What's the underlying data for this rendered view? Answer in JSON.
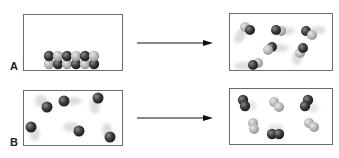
{
  "figure": {
    "panels": [
      {
        "label": "A",
        "before": {
          "state": "ordered solid lattice (two rows of packed diatomic spheres)",
          "particles": [
            {
              "cx": 49,
              "cy": 56,
              "tone": "dark"
            },
            {
              "cx": 58,
              "cy": 56,
              "tone": "light"
            },
            {
              "cx": 67,
              "cy": 56,
              "tone": "dark"
            },
            {
              "cx": 76,
              "cy": 56,
              "tone": "light"
            },
            {
              "cx": 85,
              "cy": 56,
              "tone": "dark"
            },
            {
              "cx": 94,
              "cy": 56,
              "tone": "light"
            },
            {
              "cx": 49,
              "cy": 64,
              "tone": "light"
            },
            {
              "cx": 58,
              "cy": 64,
              "tone": "dark"
            },
            {
              "cx": 67,
              "cy": 64,
              "tone": "light"
            },
            {
              "cx": 76,
              "cy": 64,
              "tone": "dark"
            },
            {
              "cx": 85,
              "cy": 64,
              "tone": "light"
            },
            {
              "cx": 94,
              "cy": 64,
              "tone": "dark"
            }
          ]
        },
        "after": {
          "state": "gas of moving diatomic molecules with motion trails",
          "molecules": [
            {
              "x1": 245,
              "y1": 27,
              "x2": 250,
              "y2": 30,
              "trail": "down-left"
            },
            {
              "x1": 276,
              "y1": 30,
              "x2": 281,
              "y2": 31,
              "trail": "left"
            },
            {
              "x1": 306,
              "y1": 31,
              "x2": 312,
              "y2": 35,
              "trail": "right"
            },
            {
              "x1": 272,
              "y1": 47,
              "x2": 268,
              "y2": 50,
              "trail": "right"
            },
            {
              "x1": 303,
              "y1": 48,
              "x2": 300,
              "y2": 53,
              "trail": "down-left"
            },
            {
              "x1": 253,
              "y1": 65,
              "x2": 258,
              "y2": 63,
              "trail": "left"
            }
          ]
        }
      },
      {
        "label": "B",
        "before": {
          "state": "gas of free atoms moving (single spheres with motion trails)",
          "atoms": [
            {
              "cx": 47,
              "cy": 107,
              "trail": "up-left"
            },
            {
              "cx": 64,
              "cy": 101,
              "trail": "right"
            },
            {
              "cx": 98,
              "cy": 98,
              "trail": "down-left"
            },
            {
              "cx": 31,
              "cy": 127,
              "trail": "down"
            },
            {
              "cx": 79,
              "cy": 131,
              "trail": "left"
            },
            {
              "cx": 110,
              "cy": 137,
              "trail": "up"
            }
          ]
        },
        "after": {
          "state": "atoms combined into diatomic molecules (some dark, some light)",
          "molecules": [
            {
              "x1": 243,
              "y1": 100,
              "x2": 245,
              "y2": 106,
              "tone": "dark"
            },
            {
              "x1": 274,
              "y1": 102,
              "x2": 279,
              "y2": 107,
              "tone": "light"
            },
            {
              "x1": 308,
              "y1": 100,
              "x2": 305,
              "y2": 106,
              "tone": "dark"
            },
            {
              "x1": 253,
              "y1": 123,
              "x2": 254,
              "y2": 129,
              "tone": "light"
            },
            {
              "x1": 272,
              "y1": 134,
              "x2": 279,
              "y2": 134,
              "tone": "dark"
            },
            {
              "x1": 309,
              "y1": 123,
              "x2": 314,
              "y2": 127,
              "tone": "light"
            }
          ]
        }
      }
    ],
    "arrows": [
      {
        "from_panel": "A",
        "direction": "right"
      },
      {
        "from_panel": "B",
        "direction": "right"
      }
    ],
    "colors": {
      "border": "#6b6b6b",
      "arrow": "#111111",
      "dark_particle": "#2f2f2f",
      "light_particle": "#b8b8b8"
    }
  }
}
